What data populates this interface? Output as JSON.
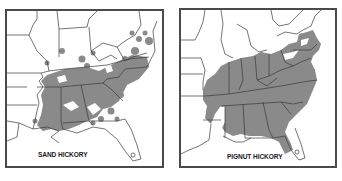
{
  "maps": [
    {
      "id": "sand-hickory",
      "label": "SAND HICKORY",
      "description": "Range map of sand hickory in the southeastern United States"
    },
    {
      "id": "pignut-hickory",
      "label": "PIGNUT HICKORY",
      "description": "Range map of pignut hickory across the eastern United States"
    }
  ],
  "colors": {
    "range_fill": "#8a8a8a",
    "state_lines": "#3a3a3a",
    "frame": "#4a4a4a",
    "background": "#ffffff"
  }
}
